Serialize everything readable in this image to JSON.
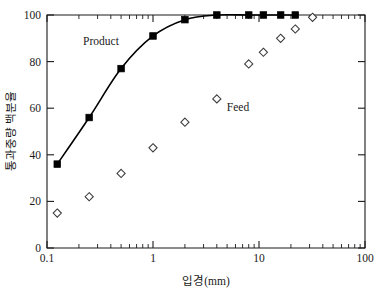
{
  "chart_data": {
    "type": "scatter",
    "title": "",
    "subtitle": "",
    "xlabel": "입경(mm)",
    "ylabel": "통과중량 백분율",
    "xscale": "log",
    "yscale": "linear",
    "xlim": [
      0.1,
      100
    ],
    "ylim": [
      0,
      100
    ],
    "grid": false,
    "legend_position": "inline-annotation",
    "xticks": [
      0.1,
      1,
      10,
      100
    ],
    "xtick_labels": [
      "0.1",
      "1",
      "10",
      "100"
    ],
    "yticks": [
      0,
      20,
      40,
      60,
      80,
      100
    ],
    "ytick_labels": [
      "0",
      "20",
      "40",
      "60",
      "80",
      "100"
    ],
    "series": [
      {
        "name": "Product",
        "marker": "filled-square",
        "line": true,
        "color": "#000000",
        "x": [
          0.125,
          0.25,
          0.5,
          1.0,
          2.0,
          4.0,
          8.0,
          11.0,
          16.0,
          22.0
        ],
        "values": [
          36,
          56,
          77,
          91,
          98,
          100,
          100,
          100,
          100,
          100
        ]
      },
      {
        "name": "Feed",
        "marker": "open-diamond",
        "line": false,
        "color": "#3a3a3a",
        "x": [
          0.125,
          0.25,
          0.5,
          1.0,
          2.0,
          4.0,
          8.0,
          11.0,
          16.0,
          22.0,
          32.0
        ],
        "values": [
          15,
          22,
          32,
          43,
          54,
          64,
          79,
          84,
          90,
          94,
          99
        ]
      }
    ],
    "annotations": [
      {
        "text": "Product",
        "x": 0.42,
        "y": 86
      },
      {
        "text": "Feed",
        "x": 5.6,
        "y": 63
      }
    ]
  },
  "axes": {
    "x_title": "입경(mm)",
    "y_title": "통과중량 백분율",
    "x_tick_0": "0.1",
    "x_tick_1": "1",
    "x_tick_2": "10",
    "x_tick_3": "100",
    "y_tick_0": "0",
    "y_tick_1": "20",
    "y_tick_2": "40",
    "y_tick_3": "60",
    "y_tick_4": "80",
    "y_tick_5": "100"
  },
  "labels": {
    "product": "Product",
    "feed": "Feed"
  }
}
